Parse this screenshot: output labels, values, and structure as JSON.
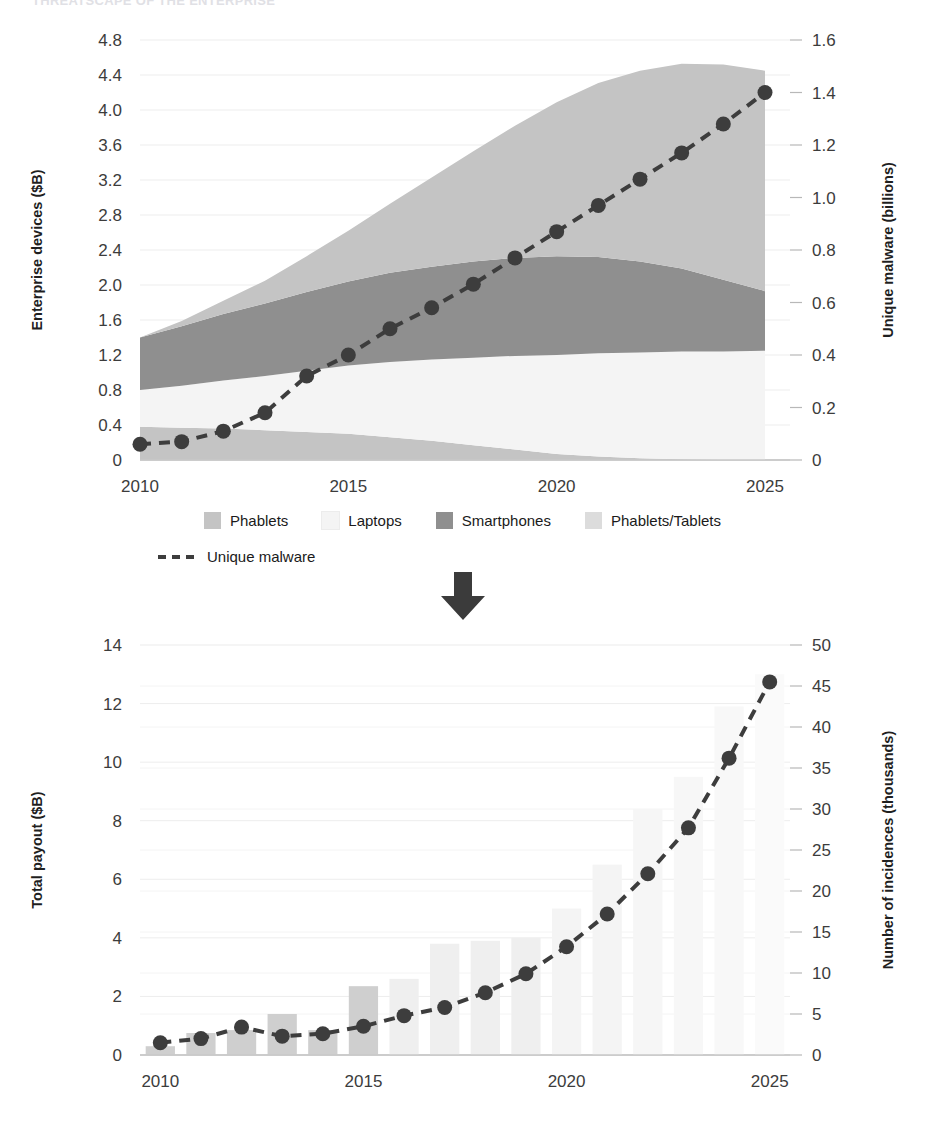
{
  "document": {
    "title": "THREATSCAPE OF THE ENTERPRISE"
  },
  "legend": {
    "items": [
      {
        "label": "Phablets",
        "color": "#c4c4c4",
        "marker": "swatch"
      },
      {
        "label": "Laptops",
        "color": "#f4f4f4",
        "marker": "swatch"
      },
      {
        "label": "Smartphones",
        "color": "#8f8f8f",
        "marker": "swatch"
      },
      {
        "label": "Phablets/Tablets",
        "color": "#dcdcdc",
        "marker": "swatch"
      }
    ],
    "line_item": {
      "label": "Unique malware",
      "color": "#3d3d3d",
      "marker": "dashed-line"
    }
  },
  "arrow": {
    "name": "down-arrow",
    "color": "#3b3b3b"
  },
  "chart_data": [
    {
      "id": "enterprise-devices-chart",
      "type": "area",
      "title": "",
      "xlabel": "",
      "ylabel": "Enterprise devices ($B)",
      "y2label": "Unique malware (billions)",
      "x": [
        2010,
        2011,
        2012,
        2013,
        2014,
        2015,
        2016,
        2017,
        2018,
        2019,
        2020,
        2021,
        2022,
        2023,
        2024,
        2025
      ],
      "xlim": [
        2010,
        2025.6
      ],
      "xticks": [
        2010,
        2015,
        2020,
        2025
      ],
      "xticklabels": [
        "2010",
        "2015",
        "2020",
        "2025"
      ],
      "ylim": [
        0,
        4.8
      ],
      "yticks": [
        0,
        0.4,
        0.8,
        1.2,
        1.6,
        2.0,
        2.4,
        2.8,
        3.2,
        3.6,
        4.0,
        4.4,
        4.8
      ],
      "yticklabels": [
        "0",
        "0.4",
        "0.8",
        "1.2",
        "1.6",
        "2.0",
        "2.4",
        "2.8",
        "3.2",
        "3.6",
        "4.0",
        "4.4",
        "4.8"
      ],
      "y2lim": [
        0,
        1.6
      ],
      "y2ticks": [
        0,
        0.2,
        0.4,
        0.6,
        0.8,
        1.0,
        1.2,
        1.4,
        1.6
      ],
      "y2ticklabels": [
        "0",
        "0.2",
        "0.4",
        "0.6",
        "0.8",
        "1.0",
        "1.2",
        "1.4",
        "1.6"
      ],
      "grid": true,
      "legend_position": "bottom",
      "stack_order_bottom_to_top": [
        "Phablets/Tablets",
        "Laptops",
        "Smartphones",
        "Phablets"
      ],
      "series": [
        {
          "name": "Phablets/Tablets",
          "color": "#c4c4c4",
          "values": [
            0.38,
            0.37,
            0.36,
            0.34,
            0.32,
            0.3,
            0.26,
            0.22,
            0.17,
            0.12,
            0.07,
            0.04,
            0.02,
            0.01,
            0.0,
            0.0
          ]
        },
        {
          "name": "Laptops",
          "color": "#f4f4f4",
          "values": [
            0.42,
            0.48,
            0.55,
            0.62,
            0.7,
            0.78,
            0.86,
            0.93,
            1.0,
            1.07,
            1.13,
            1.18,
            1.21,
            1.23,
            1.24,
            1.25
          ]
        },
        {
          "name": "Smartphones",
          "color": "#8f8f8f",
          "values": [
            0.6,
            0.68,
            0.76,
            0.83,
            0.9,
            0.96,
            1.02,
            1.06,
            1.1,
            1.12,
            1.13,
            1.1,
            1.04,
            0.95,
            0.82,
            0.68
          ]
        },
        {
          "name": "Phablets",
          "color": "#c4c4c4",
          "values": [
            0.0,
            0.06,
            0.15,
            0.26,
            0.41,
            0.58,
            0.79,
            1.02,
            1.26,
            1.51,
            1.76,
            1.99,
            2.18,
            2.34,
            2.46,
            2.52
          ]
        }
      ],
      "overlay_line": {
        "name": "Unique malware",
        "axis": "right",
        "color": "#3d3d3d",
        "style": "dashed",
        "marker": "circle",
        "values": [
          0.06,
          0.07,
          0.11,
          0.18,
          0.32,
          0.4,
          0.5,
          0.58,
          0.67,
          0.77,
          0.87,
          0.97,
          1.07,
          1.17,
          1.28,
          1.4
        ]
      }
    },
    {
      "id": "ransomware-payout-chart",
      "type": "bar",
      "title": "",
      "xlabel": "",
      "ylabel": "Total payout ($B)",
      "y2label": "Number of incidences (thousands)",
      "categories": [
        2010,
        2011,
        2012,
        2013,
        2014,
        2015,
        2016,
        2017,
        2018,
        2019,
        2020,
        2021,
        2022,
        2023,
        2024,
        2025
      ],
      "xlim": [
        2009.5,
        2025.5
      ],
      "xticks": [
        2010,
        2015,
        2020,
        2025
      ],
      "xticklabels": [
        "2010",
        "2015",
        "2020",
        "2025"
      ],
      "ylim": [
        0,
        14
      ],
      "yticks": [
        0,
        2,
        4,
        6,
        8,
        10,
        12,
        14
      ],
      "yticklabels": [
        "0",
        "2",
        "4",
        "6",
        "8",
        "10",
        "12",
        "14"
      ],
      "y2lim": [
        0,
        50
      ],
      "y2ticks": [
        0,
        5,
        10,
        15,
        20,
        25,
        30,
        35,
        40,
        45,
        50
      ],
      "y2ticklabels": [
        "0",
        "5",
        "10",
        "15",
        "20",
        "25",
        "30",
        "35",
        "40",
        "45",
        "50"
      ],
      "grid": true,
      "bars": {
        "name": "Total payout ($B)",
        "values": [
          0.3,
          0.75,
          0.85,
          1.4,
          0.85,
          2.35,
          2.6,
          3.8,
          3.9,
          4.0,
          5.0,
          6.5,
          8.4,
          9.5,
          11.9,
          13.0
        ],
        "colors": [
          "#cfcfcf",
          "#cfcfcf",
          "#cfcfcf",
          "#cfcfcf",
          "#cfcfcf",
          "#cfcfcf",
          "#efefef",
          "#efefef",
          "#efefef",
          "#efefef",
          "#f4f4f4",
          "#f4f4f4",
          "#f6f6f6",
          "#f7f7f7",
          "#f8f8f8",
          "#fafafa"
        ]
      },
      "overlay_line": {
        "name": "Number of incidences (thousands)",
        "axis": "right",
        "color": "#3d3d3d",
        "style": "dashed",
        "marker": "circle",
        "values": [
          1.5,
          2.0,
          3.4,
          2.3,
          2.6,
          3.5,
          4.8,
          5.8,
          7.6,
          9.9,
          13.2,
          17.2,
          22.1,
          27.7,
          36.2,
          45.5
        ]
      }
    }
  ]
}
